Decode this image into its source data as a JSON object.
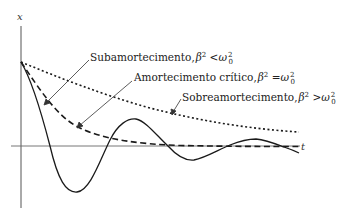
{
  "diagram": {
    "axes": {
      "y_label": "x",
      "x_label": "t"
    },
    "curves": [
      {
        "id": "underdamped",
        "label_text": "Subamortecimento,",
        "condition": {
          "lhs": "β",
          "lhs_exp": "2",
          "op": " <",
          "rhs": "ω",
          "rhs_sup": "2",
          "rhs_sub": "0"
        },
        "style": "solid"
      },
      {
        "id": "critical",
        "label_text": "Amortecimento crítico,",
        "condition": {
          "lhs": "β",
          "lhs_exp": "2",
          "op": " =",
          "rhs": "ω",
          "rhs_sup": "2",
          "rhs_sub": "0"
        },
        "style": "dashed"
      },
      {
        "id": "overdamped",
        "label_text": "Sobreamortecimento,",
        "condition": {
          "lhs": "β",
          "lhs_exp": "2",
          "op": " >",
          "rhs": "ω",
          "rhs_sup": "2",
          "rhs_sub": "0"
        },
        "style": "dotted"
      }
    ],
    "colors": {
      "line": "#1a1a1a",
      "axis": "#555555",
      "background": "#ffffff"
    }
  }
}
